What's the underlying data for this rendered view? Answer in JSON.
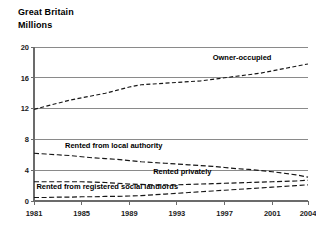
{
  "header": {
    "title": "Great Britain",
    "subtitle": "Millions"
  },
  "chart_data": {
    "type": "line",
    "title": "Great Britain",
    "subtitle": "Millions",
    "xlabel": "",
    "ylabel": "Millions",
    "xlim": [
      1981,
      2004
    ],
    "ylim": [
      0,
      20
    ],
    "yticks": [
      "0",
      "4",
      "8",
      "12",
      "16",
      "20"
    ],
    "ytick_values": [
      0,
      4,
      8,
      12,
      16,
      20
    ],
    "xticks": [
      "1981",
      "1985",
      "1989",
      "1993",
      "1997",
      "2001",
      "2004"
    ],
    "xtick_values": [
      1981,
      1985,
      1989,
      1993,
      1997,
      2001,
      2004
    ],
    "grid": "horizontal",
    "legend": "inline-annotations",
    "x": [
      1981,
      1982,
      1983,
      1984,
      1985,
      1986,
      1987,
      1988,
      1989,
      1990,
      1991,
      1992,
      1993,
      1994,
      1995,
      1996,
      1997,
      1998,
      1999,
      2000,
      2001,
      2002,
      2003,
      2004
    ],
    "series": [
      {
        "name": "Owner-occupied",
        "label": "Owner-occupied",
        "style": "dashed",
        "color": "#161616",
        "values": [
          11.9,
          12.3,
          12.7,
          13.1,
          13.4,
          13.7,
          14.0,
          14.4,
          14.8,
          15.1,
          15.2,
          15.3,
          15.4,
          15.5,
          15.6,
          15.8,
          16.0,
          16.2,
          16.4,
          16.6,
          16.9,
          17.2,
          17.5,
          17.8
        ]
      },
      {
        "name": "Rented from local authority",
        "label": "Rented from local authority",
        "style": "dashed",
        "color": "#161616",
        "values": [
          6.2,
          6.1,
          6.0,
          5.9,
          5.75,
          5.6,
          5.5,
          5.4,
          5.25,
          5.1,
          5.0,
          4.9,
          4.8,
          4.7,
          4.6,
          4.5,
          4.35,
          4.2,
          4.1,
          3.95,
          3.8,
          3.6,
          3.4,
          3.1
        ]
      },
      {
        "name": "Rented privately",
        "label": "Rented privately",
        "style": "dashed",
        "color": "#161616",
        "values": [
          2.5,
          2.5,
          2.5,
          2.5,
          2.5,
          2.45,
          2.4,
          2.3,
          2.2,
          2.15,
          2.1,
          2.1,
          2.1,
          2.15,
          2.2,
          2.25,
          2.3,
          2.35,
          2.4,
          2.45,
          2.5,
          2.55,
          2.6,
          2.7
        ]
      },
      {
        "name": "Rented from registered social landlords",
        "label": "Rented from registered social landlords",
        "style": "dashed",
        "color": "#161616",
        "values": [
          0.45,
          0.45,
          0.5,
          0.5,
          0.55,
          0.55,
          0.6,
          0.6,
          0.65,
          0.7,
          0.8,
          0.9,
          1.0,
          1.1,
          1.2,
          1.3,
          1.4,
          1.5,
          1.6,
          1.7,
          1.8,
          1.9,
          2.0,
          2.1
        ]
      }
    ],
    "annotations": [
      {
        "text": "Owner-occupied",
        "x": 1996.0,
        "y": 18.3
      },
      {
        "text": "Rented from local authority",
        "x": 1983.6,
        "y": 6.9
      },
      {
        "text": "Rented privately",
        "x": 1991.0,
        "y": 3.55
      },
      {
        "text": "Rented from registered social landlords",
        "x": 1981.2,
        "y": 1.55
      }
    ]
  }
}
